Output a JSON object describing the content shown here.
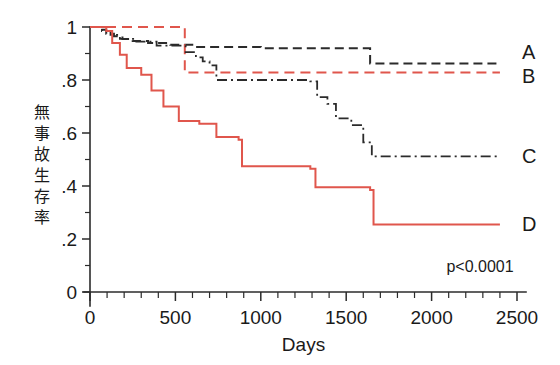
{
  "chart_data": {
    "type": "line",
    "subtype": "kaplan-meier-step",
    "title": "",
    "xlabel": "Days",
    "ylabel": "無事故生存率",
    "ylabel_chars": [
      "無",
      "事",
      "故",
      "生",
      "存",
      "率"
    ],
    "xlim": [
      0,
      2500
    ],
    "ylim": [
      0,
      1
    ],
    "xticks": [
      0,
      500,
      1000,
      1500,
      2000,
      2500
    ],
    "xtick_labels": [
      "0",
      "500",
      "1000",
      "1500",
      "2000",
      "2500"
    ],
    "xminor_step": 100,
    "yticks": [
      0,
      0.2,
      0.4,
      0.6,
      0.8,
      1
    ],
    "ytick_labels": [
      "0",
      ".2",
      ".4",
      ".6",
      ".8",
      "1"
    ],
    "yminor_step": 0.1,
    "grid": false,
    "legend_position": "right-inline",
    "annotations": [
      {
        "name": "p-value",
        "text": "p<0.0001",
        "x": 2480,
        "y": 0.075
      }
    ],
    "series": [
      {
        "name": "A",
        "label": "A",
        "color": "#2b2b2b",
        "dash": "dashed",
        "dasharray": "9,5",
        "width": 2.0,
        "label_x": 2530,
        "label_y": 0.905,
        "final_value": 0.862,
        "points": [
          [
            0,
            1.0
          ],
          [
            60,
            0.99
          ],
          [
            95,
            0.975
          ],
          [
            140,
            0.965
          ],
          [
            190,
            0.955
          ],
          [
            250,
            0.947
          ],
          [
            340,
            0.94
          ],
          [
            470,
            0.933
          ],
          [
            620,
            0.925
          ],
          [
            1000,
            0.92
          ],
          [
            1640,
            0.862
          ],
          [
            2400,
            0.862
          ]
        ]
      },
      {
        "name": "B",
        "label": "B",
        "color": "#e0564c",
        "dash": "dashed",
        "dasharray": "10,6",
        "width": 2.0,
        "label_x": 2530,
        "label_y": 0.815,
        "final_value": 0.828,
        "points": [
          [
            0,
            1.0
          ],
          [
            555,
            1.0
          ],
          [
            555,
            0.828
          ],
          [
            2400,
            0.828
          ]
        ]
      },
      {
        "name": "C",
        "label": "C",
        "color": "#2b2b2b",
        "dash": "dashdot",
        "dasharray": "10,4,2,4",
        "width": 1.8,
        "label_x": 2530,
        "label_y": 0.512,
        "final_value": 0.512,
        "points": [
          [
            0,
            1.0
          ],
          [
            70,
            0.985
          ],
          [
            120,
            0.97
          ],
          [
            175,
            0.955
          ],
          [
            260,
            0.945
          ],
          [
            390,
            0.93
          ],
          [
            560,
            0.905
          ],
          [
            620,
            0.885
          ],
          [
            660,
            0.87
          ],
          [
            700,
            0.855
          ],
          [
            740,
            0.8
          ],
          [
            1290,
            0.795
          ],
          [
            1330,
            0.735
          ],
          [
            1390,
            0.71
          ],
          [
            1440,
            0.655
          ],
          [
            1530,
            0.63
          ],
          [
            1600,
            0.565
          ],
          [
            1650,
            0.512
          ],
          [
            2400,
            0.512
          ]
        ]
      },
      {
        "name": "D",
        "label": "D",
        "color": "#e0564c",
        "dash": "solid",
        "dasharray": "",
        "width": 2.0,
        "label_x": 2530,
        "label_y": 0.255,
        "final_value": 0.255,
        "points": [
          [
            0,
            1.0
          ],
          [
            95,
            0.985
          ],
          [
            130,
            0.94
          ],
          [
            175,
            0.895
          ],
          [
            215,
            0.845
          ],
          [
            300,
            0.82
          ],
          [
            360,
            0.76
          ],
          [
            430,
            0.7
          ],
          [
            520,
            0.645
          ],
          [
            640,
            0.635
          ],
          [
            740,
            0.585
          ],
          [
            870,
            0.575
          ],
          [
            890,
            0.475
          ],
          [
            1290,
            0.465
          ],
          [
            1320,
            0.395
          ],
          [
            1640,
            0.385
          ],
          [
            1660,
            0.255
          ],
          [
            2400,
            0.255
          ]
        ]
      }
    ]
  },
  "colors": {
    "red": "#e0564c",
    "black": "#2b2b2b",
    "background": "#ffffff"
  }
}
